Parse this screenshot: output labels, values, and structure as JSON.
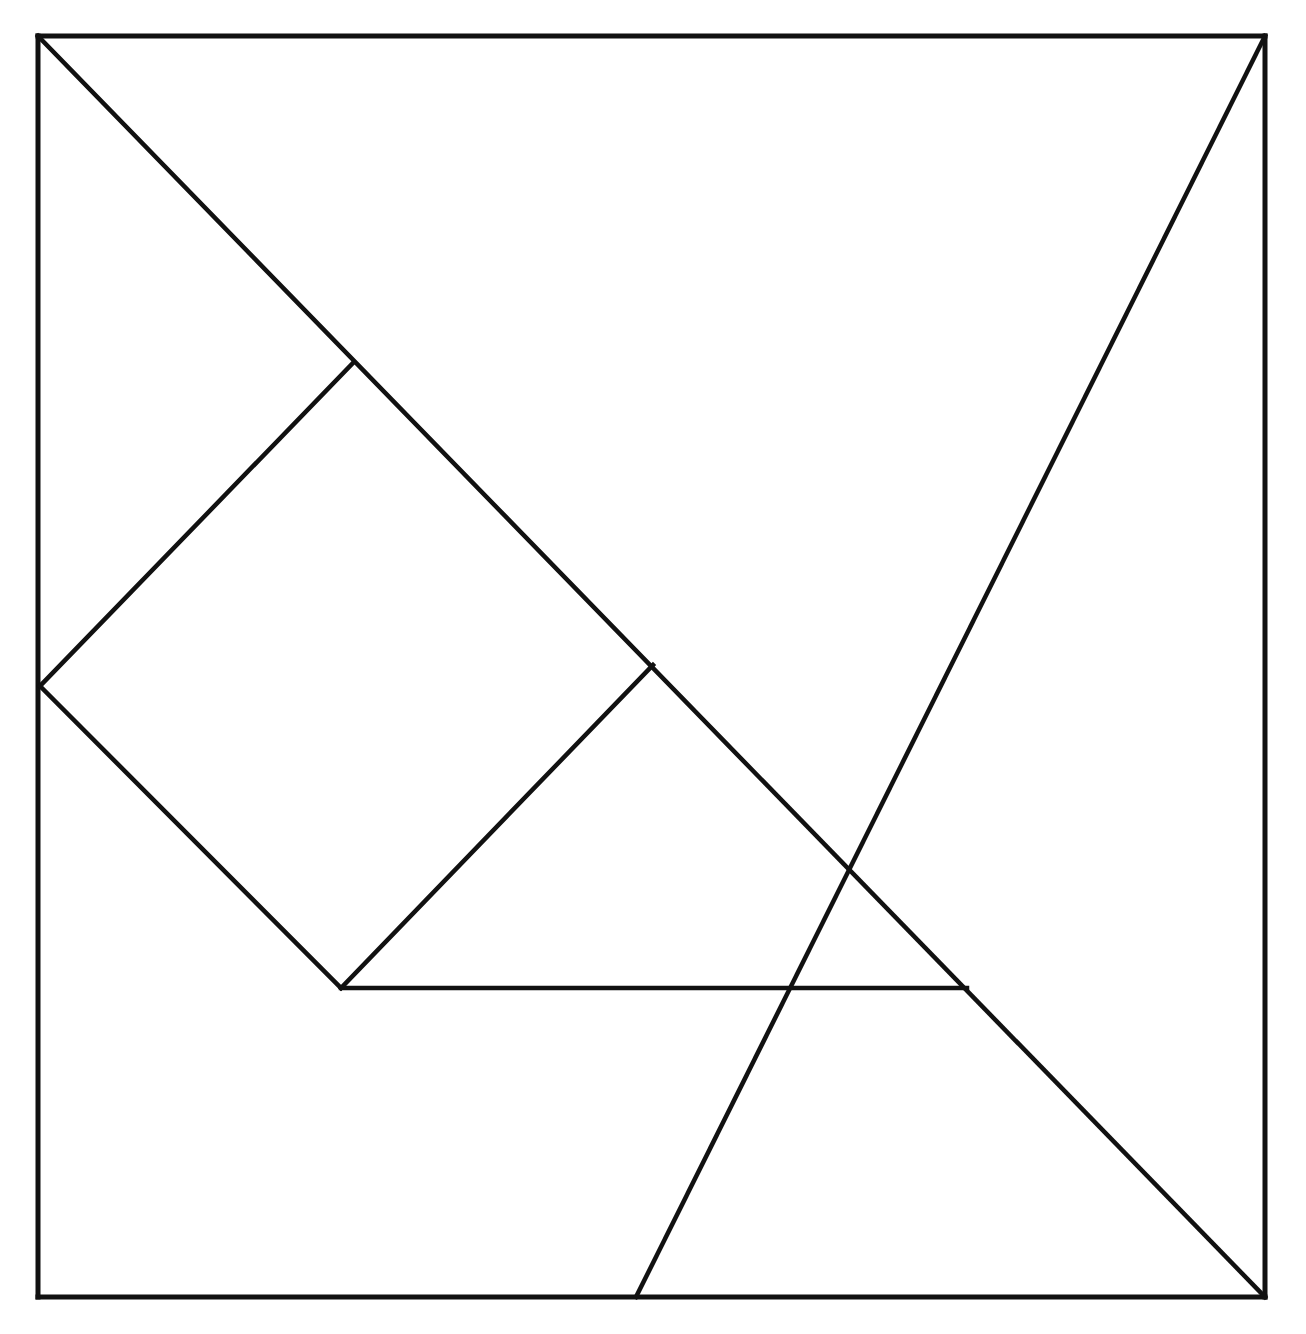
{
  "figure": {
    "type": "geometric-line-diagram",
    "background_color": "#ffffff",
    "line_color": "#111111",
    "canvas": {
      "width": 1306,
      "height": 1334
    },
    "outer_square": {
      "name": "tangram-outer-square",
      "stroke_width": 5,
      "corners": {
        "top_left": [
          38,
          36
        ],
        "top_right": [
          1265,
          36
        ],
        "bottom_right": [
          1265,
          1297
        ],
        "bottom_left": [
          38,
          1297
        ]
      },
      "side_length_px": 1227
    },
    "key_points": {
      "top_left": [
        38,
        36
      ],
      "top_right": [
        1265,
        36
      ],
      "bottom_right": [
        1265,
        1297
      ],
      "bottom_left": [
        38,
        1297
      ],
      "center_crossing": [
        653,
        665
      ],
      "diamond_top": [
        353,
        363
      ],
      "diamond_left": [
        40,
        686
      ],
      "diamond_bottom": [
        341,
        988
      ],
      "horizontal_right_end": [
        967,
        988
      ],
      "anti_diagonal_bottom_end": [
        636,
        1297
      ]
    },
    "cut_lines": [
      {
        "name": "main-diagonal",
        "description": "Long diagonal from top-left corner to bottom-right corner",
        "from": [
          38,
          36
        ],
        "to": [
          1265,
          1297
        ],
        "stroke_width": 4.5
      },
      {
        "name": "anti-diagonal",
        "description": "Diagonal from top-right corner down-left through centre to bottom edge",
        "from": [
          1265,
          36
        ],
        "to": [
          636,
          1297
        ],
        "stroke_width": 4.5
      },
      {
        "name": "square-piece-upper-left-edge",
        "description": "Edge of inner square from diamond top vertex to diamond left vertex",
        "from": [
          353,
          363
        ],
        "to": [
          40,
          686
        ],
        "stroke_width": 4.5
      },
      {
        "name": "square-piece-lower-left-edge",
        "description": "Edge of inner square from diamond left vertex to diamond bottom vertex",
        "from": [
          40,
          686
        ],
        "to": [
          341,
          988
        ],
        "stroke_width": 4.5
      },
      {
        "name": "square-piece-lower-right-edge",
        "description": "Edge of inner square from diamond bottom vertex to centre crossing",
        "from": [
          341,
          988
        ],
        "to": [
          653,
          665
        ],
        "stroke_width": 4.5
      },
      {
        "name": "horizontal-cut",
        "description": "Horizontal segment from diamond bottom vertex to the main diagonal",
        "from": [
          341,
          988
        ],
        "to": [
          967,
          988
        ],
        "stroke_width": 4.5
      }
    ],
    "pieces": [
      {
        "name": "large-triangle-upper-right",
        "label": "Large triangle (upper right)"
      },
      {
        "name": "large-triangle-lower-left",
        "label": "Large triangle (lower left)"
      },
      {
        "name": "inner-square-piece",
        "label": "Square / rhombus piece"
      },
      {
        "name": "medium-triangle",
        "label": "Medium triangle"
      },
      {
        "name": "small-triangle",
        "label": "Small triangle"
      },
      {
        "name": "trapezoid-piece",
        "label": "Trapezoid piece"
      }
    ]
  }
}
